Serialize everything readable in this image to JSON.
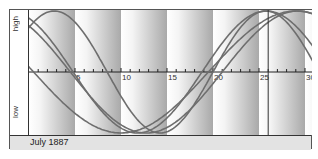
{
  "chart_data": {
    "type": "line",
    "title": "July 1887",
    "xlabel": "",
    "ylabel_top": "high",
    "ylabel_bottom": "low",
    "x_range": [
      0,
      30.8
    ],
    "x_ticks": [
      5,
      10,
      15,
      20,
      25,
      30
    ],
    "minor_tick_step": 1,
    "y_range": [
      -1,
      1
    ],
    "today_marker_day": 26,
    "band_width_days": 5,
    "series": [
      {
        "name": "cycle-23",
        "period": 23,
        "zero_up_day": -3
      },
      {
        "name": "cycle-28",
        "period": 28,
        "zero_up_day": -9.2
      },
      {
        "name": "cycle-33",
        "period": 33,
        "zero_up_day": -12
      },
      {
        "name": "cycle-38",
        "period": 38,
        "zero_up_day": -18.5
      }
    ],
    "colors": {
      "curve": "#6e6e6e",
      "axis": "#222222",
      "band_dark": "#a9a9a9",
      "band_light": "#ffffff",
      "marker": "#333333"
    }
  },
  "labels": {
    "high": "high",
    "low": "low",
    "footer": "July 1887"
  }
}
